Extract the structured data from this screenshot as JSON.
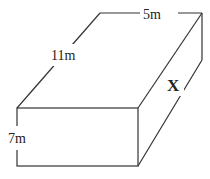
{
  "diagram": {
    "type": "rectangular-prism",
    "labels": {
      "width": "5m",
      "length": "11m",
      "height": "7m",
      "diagonal_side": "X"
    },
    "colors": {
      "stroke": "#333333",
      "text": "#222222",
      "background": "#ffffff"
    }
  }
}
